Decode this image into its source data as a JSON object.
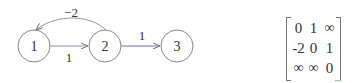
{
  "graph": {
    "nodes": [
      {
        "id": "1",
        "label": "1",
        "cx": 34,
        "cy": 46,
        "r": 16
      },
      {
        "id": "2",
        "label": "2",
        "cx": 105,
        "cy": 46,
        "r": 16
      },
      {
        "id": "3",
        "label": "3",
        "cx": 177,
        "cy": 46,
        "r": 16
      }
    ],
    "edges": [
      {
        "from": "1",
        "to": "2",
        "weight": "1",
        "color": "#8a8ab8"
      },
      {
        "from": "2",
        "to": "3",
        "weight": "1",
        "color": "#6a6ad0"
      },
      {
        "from": "2",
        "to": "1",
        "weight": "−2",
        "color": "#999999",
        "curved": true
      }
    ]
  },
  "matrix": {
    "rows": [
      [
        "0",
        "1",
        "∞"
      ],
      [
        "-2",
        "0",
        "1"
      ],
      [
        "∞",
        "∞",
        "0"
      ]
    ]
  }
}
